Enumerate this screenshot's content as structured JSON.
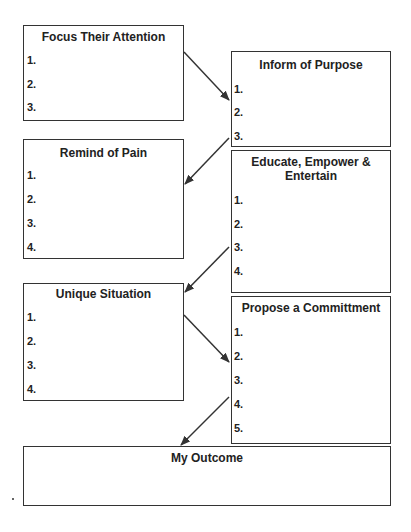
{
  "boxes": {
    "focus": {
      "title": "Focus Their Attention",
      "items": [
        "1.",
        "2.",
        "3."
      ]
    },
    "inform": {
      "title": "Inform of Purpose",
      "items": [
        "1.",
        "2.",
        "3."
      ]
    },
    "pain": {
      "title": "Remind of Pain",
      "items": [
        "1.",
        "2.",
        "3.",
        "4."
      ]
    },
    "educate": {
      "title": "Educate, Empower & Entertain",
      "items": [
        "1.",
        "2.",
        "3.",
        "4."
      ]
    },
    "unique": {
      "title": "Unique Situation",
      "items": [
        "1.",
        "2.",
        "3.",
        "4."
      ]
    },
    "propose": {
      "title": "Propose a Committment",
      "items": [
        "1.",
        "2.",
        "3.",
        "4.",
        "5."
      ]
    },
    "outcome": {
      "title": "My Outcome"
    }
  },
  "colors": {
    "line": "#333333",
    "text": "#222222",
    "background": "#ffffff"
  }
}
